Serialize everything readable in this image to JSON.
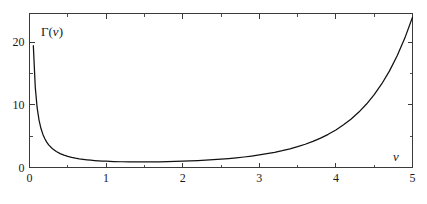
{
  "chart_data": {
    "type": "line",
    "title": "",
    "subtitle": "",
    "xlabel": "v",
    "ylabel": "Γ(v)",
    "ylabel_display": "Γ(v)",
    "xlim": [
      0,
      5
    ],
    "ylim": [
      0,
      24.6
    ],
    "grid": false,
    "legend": false,
    "legend_position": "none",
    "x_ticks_major": [
      0,
      1,
      2,
      3,
      4,
      5
    ],
    "x_tick_labels": [
      "0",
      "1",
      "2",
      "3",
      "4",
      "5"
    ],
    "x_ticks_minor": [
      0.5,
      1.5,
      2.5,
      3.5,
      4.5
    ],
    "y_ticks_major": [
      0,
      10,
      20
    ],
    "y_tick_labels": [
      "0",
      "10",
      "20"
    ],
    "y_ticks_minor": [
      5,
      15
    ],
    "series": [
      {
        "name": "Γ(v)",
        "color": "#111111",
        "x": [
          0.05,
          0.075,
          0.1,
          0.125,
          0.15,
          0.175,
          0.2,
          0.225,
          0.25,
          0.3,
          0.35,
          0.4,
          0.45,
          0.5,
          0.55,
          0.6,
          0.65,
          0.7,
          0.75,
          0.8,
          0.85,
          0.9,
          0.95,
          1.0,
          1.1,
          1.2,
          1.3,
          1.4,
          1.4616,
          1.5,
          1.6,
          1.7,
          1.8,
          1.9,
          2.0,
          2.1,
          2.2,
          2.3,
          2.4,
          2.5,
          2.6,
          2.7,
          2.8,
          2.9,
          3.0,
          3.1,
          3.2,
          3.3,
          3.4,
          3.5,
          3.6,
          3.7,
          3.8,
          3.9,
          4.0,
          4.1,
          4.2,
          4.3,
          4.4,
          4.5,
          4.6,
          4.7,
          4.8,
          4.9,
          5.0
        ],
        "y": [
          19.4701,
          12.8883,
          9.5135,
          7.5339,
          6.2203,
          5.2893,
          4.5908,
          4.0471,
          3.6126,
          2.9916,
          2.5461,
          2.2182,
          1.9687,
          1.7725,
          1.6145,
          1.4892,
          1.3848,
          1.2981,
          1.2254,
          1.1642,
          1.1125,
          1.0686,
          1.0315,
          1.0,
          0.9514,
          0.9182,
          0.8975,
          0.8873,
          0.8856,
          0.8862,
          0.8935,
          0.9086,
          0.9314,
          0.9618,
          1.0,
          1.0465,
          1.1018,
          1.1667,
          1.2422,
          1.3293,
          1.4296,
          1.5447,
          1.6765,
          1.8274,
          2.0,
          2.1976,
          2.424,
          2.6834,
          2.9812,
          3.3234,
          3.717,
          4.1707,
          4.6942,
          5.2993,
          6.0,
          6.8126,
          7.7567,
          8.8553,
          10.1361,
          11.6317,
          13.3813,
          15.4312,
          17.8378,
          20.6672,
          24.0
        ]
      }
    ],
    "annotations": [
      {
        "text": "Γ(v)",
        "role": "y-axis-label",
        "x": 0.28,
        "y": 21.8
      },
      {
        "text": "v",
        "role": "x-axis-label",
        "x": 4.72,
        "y": 2.6
      }
    ]
  },
  "axes": {
    "y_label_text": "Γ(v)",
    "y_label_gamma": "Γ",
    "y_label_paren_open": "(",
    "y_label_var": "v",
    "y_label_paren_close": ")",
    "x_label_text": "v"
  },
  "colors": {
    "curve": "#111111",
    "frame": "#3a3a3a",
    "text": "#1a1a1a",
    "background": "#ffffff"
  }
}
